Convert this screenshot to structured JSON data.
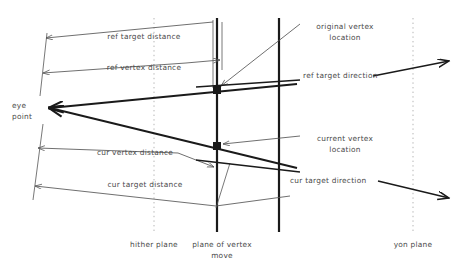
{
  "diagram": {
    "colors": {
      "line_dark": "#1a1a1a",
      "line_thin": "#555555",
      "dotted": "#b0b0b0",
      "text": "#4a4a4a",
      "background": "#ffffff"
    },
    "labels": {
      "ref_target_distance": "ref target distance",
      "ref_vertex_distance": "ref vertex distance",
      "cur_vertex_distance": "cur vertex distance",
      "cur_target_distance": "cur target distance",
      "eye_point_line1": "eye",
      "eye_point_line2": "point",
      "original_vertex_line1": "original vertex",
      "original_vertex_line2": "location",
      "current_vertex_line1": "current vertex",
      "current_vertex_line2": "location",
      "ref_target_direction": "ref target direction",
      "cur_target_direction": "cur target direction",
      "hither_plane": "hither plane",
      "plane_of_vertex_move_line1": "plane of vertex",
      "plane_of_vertex_move_line2": "move",
      "yon_plane": "yon plane"
    },
    "label_positions": {
      "ref_target_distance": {
        "x": 144,
        "y": 32,
        "align": "c"
      },
      "ref_vertex_distance": {
        "x": 144,
        "y": 63,
        "align": "c"
      },
      "cur_vertex_distance": {
        "x": 135,
        "y": 148,
        "align": "c"
      },
      "cur_target_distance": {
        "x": 145,
        "y": 180,
        "align": "c"
      },
      "eye_point": {
        "x": 12,
        "y": 103,
        "align": "l"
      },
      "original_vertex": {
        "x": 345,
        "y": 22,
        "align": "c"
      },
      "current_vertex": {
        "x": 345,
        "y": 134,
        "align": "c"
      },
      "ref_target_direction": {
        "x": 303,
        "y": 73,
        "align": "l"
      },
      "cur_target_direction": {
        "x": 290,
        "y": 178,
        "align": "l"
      },
      "hither_plane": {
        "x": 154,
        "y": 243,
        "align": "c"
      },
      "plane_of_vertex_move": {
        "x": 222,
        "y": 243,
        "align": "c"
      },
      "yon_plane": {
        "x": 413,
        "y": 243,
        "align": "c"
      }
    }
  },
  "geometry": {
    "eye_point": {
      "x": 50,
      "y": 108
    },
    "original_vertex": {
      "x": 217,
      "y": 90
    },
    "current_vertex": {
      "x": 217,
      "y": 146
    },
    "hither_plane_x": 154,
    "vertex_plane_x": 217,
    "second_plane_x": 279,
    "yon_plane_x": 413,
    "vertical_top": 18,
    "vertical_bottom": 232
  }
}
